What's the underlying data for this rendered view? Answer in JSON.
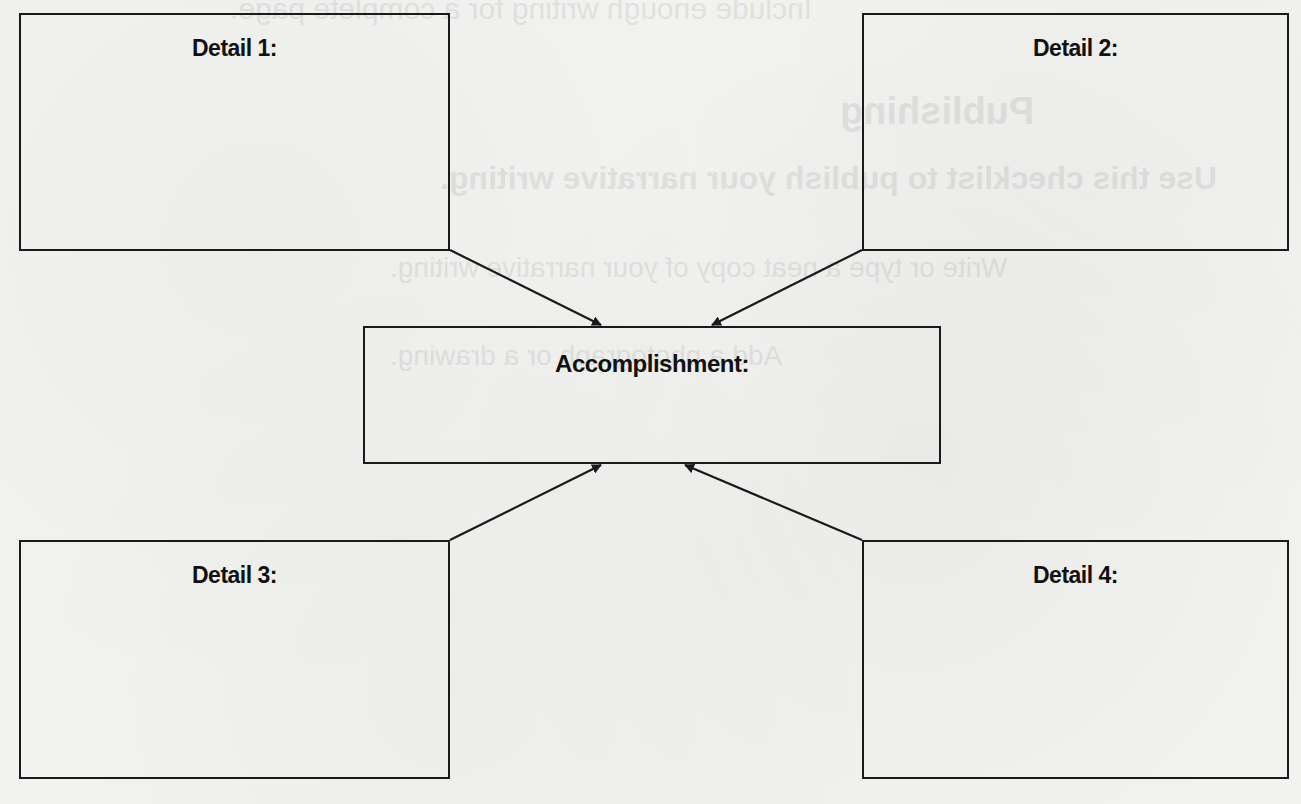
{
  "diagram": {
    "type": "graphic-organizer",
    "center": {
      "id": "accomplishment",
      "label": "Accomplishment:"
    },
    "details": [
      {
        "id": "detail-1",
        "label": "Detail 1:",
        "position": "top-left"
      },
      {
        "id": "detail-2",
        "label": "Detail 2:",
        "position": "top-right"
      },
      {
        "id": "detail-3",
        "label": "Detail 3:",
        "position": "bottom-left"
      },
      {
        "id": "detail-4",
        "label": "Detail 4:",
        "position": "bottom-right"
      }
    ],
    "connections": [
      {
        "from": "detail-1",
        "to": "accomplishment"
      },
      {
        "from": "detail-2",
        "to": "accomplishment"
      },
      {
        "from": "detail-3",
        "to": "accomplishment"
      },
      {
        "from": "detail-4",
        "to": "accomplishment"
      }
    ],
    "colors": {
      "stroke": "#1a1a1a",
      "text": "#111111",
      "paper": "#f2f2f0"
    }
  },
  "bleed_through_text": [
    "Include enough writing for a complete page.",
    "Publishing",
    "Use this checklist to publish your narrative writing.",
    "Write or type a neat copy of your narrative writing.",
    "Add a photograph or a drawing."
  ]
}
